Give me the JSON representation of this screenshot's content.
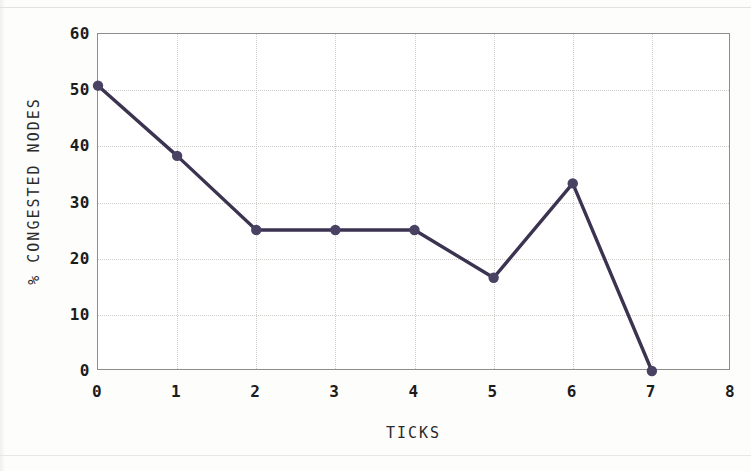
{
  "chart_data": {
    "type": "line",
    "title": "",
    "subtitle": "",
    "xlabel": "TICKS",
    "ylabel": "% CONGESTED NODES",
    "x": [
      0,
      1,
      2,
      3,
      4,
      5,
      6,
      7
    ],
    "values": [
      50.8,
      38.3,
      25.1,
      25.1,
      25.1,
      16.6,
      33.4,
      0
    ],
    "series": [
      {
        "name": "",
        "values": [
          50.8,
          38.3,
          25.1,
          25.1,
          25.1,
          16.6,
          33.4,
          0
        ]
      }
    ],
    "xlim": [
      0,
      8
    ],
    "ylim": [
      0,
      60
    ],
    "xticks": [
      0,
      1,
      2,
      3,
      4,
      5,
      6,
      7,
      8
    ],
    "xtick_labels": [
      "0",
      "1",
      "2",
      "3",
      "4",
      "5",
      "6",
      "7",
      "8"
    ],
    "yticks": [
      0,
      10,
      20,
      30,
      40,
      50,
      60
    ],
    "ytick_labels": [
      "0",
      "10",
      "20",
      "30",
      "40",
      "50",
      "60"
    ],
    "grid": true,
    "legend": false,
    "legend_position": "none",
    "marker": "circle",
    "line_color": "#3b3350",
    "marker_color": "#4a4263",
    "grid_color": "#cfcecb",
    "frame_color": "#8e8d8b",
    "background_color": "#ffffff",
    "annotations": []
  }
}
